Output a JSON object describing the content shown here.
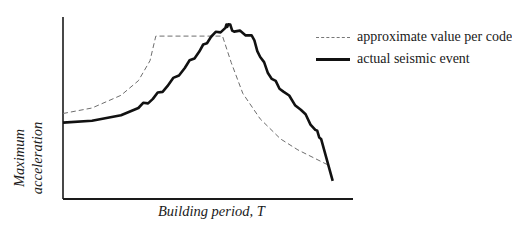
{
  "chart_data": {
    "type": "line",
    "title": "",
    "xlabel": "Building period, T",
    "ylabel": "Maximum acceleration",
    "ylabel_lines": [
      "Maximum",
      "acceleration"
    ],
    "grid": false,
    "ticks": false,
    "legend_position": "top-right",
    "axis_ranges_note": "qualitative (no numeric ticks); normalized 0-1",
    "x_range": [
      0,
      1
    ],
    "y_range": [
      0,
      1
    ],
    "series": [
      {
        "name": "approximate value per code",
        "style": "dashed",
        "color": "#777777",
        "points": [
          [
            0.0,
            0.47
          ],
          [
            0.1,
            0.5
          ],
          [
            0.2,
            0.57
          ],
          [
            0.26,
            0.65
          ],
          [
            0.3,
            0.76
          ],
          [
            0.32,
            0.895
          ],
          [
            0.55,
            0.895
          ],
          [
            0.58,
            0.75
          ],
          [
            0.62,
            0.58
          ],
          [
            0.68,
            0.44
          ],
          [
            0.75,
            0.33
          ],
          [
            0.81,
            0.27
          ],
          [
            0.91,
            0.19
          ]
        ]
      },
      {
        "name": "actual seismic event",
        "style": "solid",
        "color": "#111111",
        "points": [
          [
            0.0,
            0.42
          ],
          [
            0.1,
            0.43
          ],
          [
            0.2,
            0.46
          ],
          [
            0.26,
            0.5
          ],
          [
            0.31,
            0.55
          ],
          [
            0.36,
            0.62
          ],
          [
            0.42,
            0.72
          ],
          [
            0.47,
            0.81
          ],
          [
            0.51,
            0.89
          ],
          [
            0.56,
            0.94
          ],
          [
            0.57,
            0.96
          ],
          [
            0.59,
            0.92
          ],
          [
            0.65,
            0.9
          ],
          [
            0.68,
            0.78
          ],
          [
            0.72,
            0.66
          ],
          [
            0.76,
            0.59
          ],
          [
            0.82,
            0.49
          ],
          [
            0.87,
            0.38
          ],
          [
            0.89,
            0.33
          ],
          [
            0.93,
            0.1
          ]
        ]
      }
    ]
  },
  "legend": {
    "items": [
      {
        "label": "approximate value per code",
        "style": "dashed"
      },
      {
        "label": "actual seismic event",
        "style": "solid"
      }
    ]
  },
  "axes": {
    "ylabel_line1": "Maximum",
    "ylabel_line2": "acceleration",
    "xlabel": "Building period, T"
  }
}
